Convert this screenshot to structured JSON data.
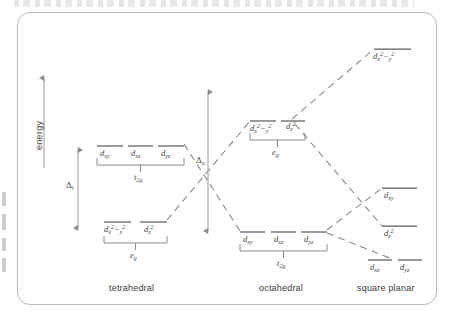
{
  "figure": {
    "type": "crystal-field-splitting-diagram",
    "axis": {
      "energy_label": "energy",
      "direction": "up"
    },
    "splittings": [
      {
        "id": "delta-t",
        "symbol": "Δ",
        "subscript": "t",
        "geometry": "tetrahedral"
      },
      {
        "id": "delta-o",
        "symbol": "Δ",
        "subscript": "o",
        "geometry": "octahedral"
      }
    ],
    "geometries": [
      {
        "id": "tetrahedral",
        "label": "tetrahedral"
      },
      {
        "id": "octahedral",
        "label": "octahedral"
      },
      {
        "id": "square-planar",
        "label": "square planar"
      }
    ],
    "tetrahedral": {
      "upper_set": {
        "term": "t",
        "term_sub": "2g",
        "orbitals": [
          {
            "d": "d",
            "sub": "xy"
          },
          {
            "d": "d",
            "sub": "xz"
          },
          {
            "d": "d",
            "sub": "yz"
          }
        ]
      },
      "lower_set": {
        "term": "e",
        "term_sub": "g",
        "orbitals": [
          {
            "d": "d",
            "sub": "x",
            "sup1": "2",
            "minus": "−",
            "sub2": "y",
            "sup2": "2"
          },
          {
            "d": "d",
            "sub": "z",
            "sup1": "2"
          }
        ]
      }
    },
    "octahedral": {
      "upper_set": {
        "term": "e",
        "term_sub": "g",
        "orbitals": [
          {
            "d": "d",
            "sub": "x",
            "sup1": "2",
            "minus": "−",
            "sub2": "y",
            "sup2": "2"
          },
          {
            "d": "d",
            "sub": "z",
            "sup1": "2"
          }
        ]
      },
      "lower_set": {
        "term": "t",
        "term_sub": "2g",
        "orbitals": [
          {
            "d": "d",
            "sub": "xy"
          },
          {
            "d": "d",
            "sub": "xz"
          },
          {
            "d": "d",
            "sub": "yz"
          }
        ]
      }
    },
    "square_planar": {
      "levels": [
        {
          "rank": 1,
          "d": "d",
          "sub": "x",
          "sup1": "2",
          "minus": "−",
          "sub2": "y",
          "sup2": "2"
        },
        {
          "rank": 2,
          "d": "d",
          "sub": "xy"
        },
        {
          "rank": 3,
          "d": "d",
          "sub": "z",
          "sup1": "2"
        },
        {
          "rank": 4,
          "d": "d",
          "sub": "xz"
        },
        {
          "rank": 5,
          "d": "d",
          "sub": "yz"
        }
      ]
    },
    "colors": {
      "line": "#6b6b6b",
      "dashed": "#8a8a8a",
      "border": "#b9b9b9",
      "text": "#3d3d3d",
      "background": "#ffffff"
    }
  }
}
